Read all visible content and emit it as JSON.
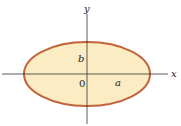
{
  "diagram": {
    "type": "ellipse-on-axes",
    "labels": {
      "x_axis": "x",
      "y_axis": "y",
      "origin": "0",
      "semi_major": "a",
      "semi_minor": "b"
    },
    "colors": {
      "fill": "#fbecc4",
      "stroke": "#c0643a",
      "axis": "#333333"
    }
  }
}
